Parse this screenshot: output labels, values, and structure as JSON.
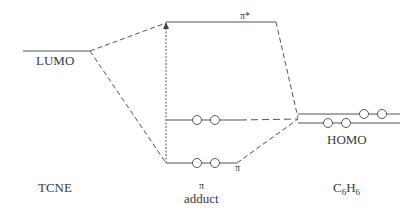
{
  "diagram": {
    "type": "molecular-orbital-energy-diagram",
    "columns": [
      {
        "id": "tcne",
        "label": "TCNE"
      },
      {
        "id": "adduct",
        "label_symbol": "π",
        "label": "adduct"
      },
      {
        "id": "benzene",
        "label_main": "C",
        "label_sub1": "6",
        "label_mid": "H",
        "label_sub2": "6"
      }
    ],
    "levels": {
      "tcne_lumo": {
        "label": "LUMO"
      },
      "adduct_pi_star": {
        "label": "π*"
      },
      "adduct_middle": {
        "electrons": 2
      },
      "adduct_pi": {
        "label": "π",
        "electrons": 2
      },
      "benzene_homo": {
        "label": "HOMO",
        "electrons": 4
      }
    },
    "colors": {
      "line": "#555555",
      "text": "#3a3a3a"
    }
  }
}
